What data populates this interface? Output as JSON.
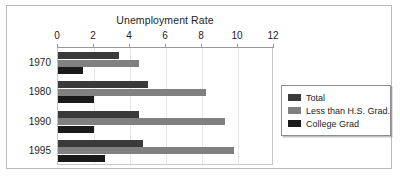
{
  "chart_data": {
    "type": "bar",
    "orientation": "horizontal",
    "title": "Unemployment Rate",
    "xlabel": "",
    "ylabel": "",
    "categories": [
      "1970",
      "1980",
      "1990",
      "1995"
    ],
    "xlim": [
      0,
      12
    ],
    "xticks": [
      0,
      2,
      4,
      6,
      8,
      10,
      12
    ],
    "xtick_labels": [
      "0",
      "2",
      "4",
      "6",
      "8",
      "10",
      "12"
    ],
    "grid": true,
    "legend_position": "right",
    "series": [
      {
        "name": "Total",
        "color": "#3a3a3a",
        "values": [
          3.4,
          5.0,
          4.5,
          4.7
        ]
      },
      {
        "name": "Less than H.S. Grad.",
        "color": "#808080",
        "values": [
          4.5,
          8.2,
          9.3,
          9.8
        ]
      },
      {
        "name": "College Grad",
        "color": "#1a1a1a",
        "values": [
          1.4,
          2.0,
          2.0,
          2.6
        ]
      }
    ]
  },
  "colors": {
    "frame_border": "#b9b9b9",
    "plot_border": "#c8c8c8",
    "axis_line": "#9a9a9a",
    "gridline": "#e8e8e8",
    "text": "#1d1d1d",
    "legend_border": "#8e8e8e",
    "background": "#ffffff"
  }
}
